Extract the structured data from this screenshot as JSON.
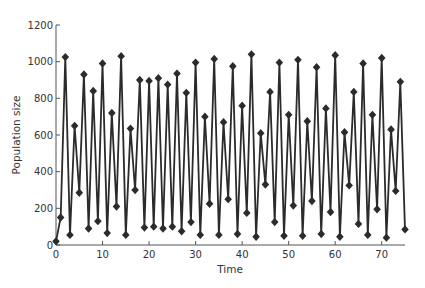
{
  "chart_data": {
    "type": "line",
    "title": "",
    "xlabel": "Time",
    "ylabel": "Population size",
    "xlim": [
      0,
      75
    ],
    "ylim": [
      0,
      1200
    ],
    "x_ticks": [
      0,
      10,
      20,
      30,
      40,
      50,
      60,
      70
    ],
    "y_ticks": [
      0,
      200,
      400,
      600,
      800,
      1000,
      1200
    ],
    "grid": false,
    "legend": null,
    "marker": "diamond",
    "series": [
      {
        "name": "Population size",
        "color": "#2b2b2b",
        "x": [
          0,
          1,
          2,
          3,
          4,
          5,
          6,
          7,
          8,
          9,
          10,
          11,
          12,
          13,
          14,
          15,
          16,
          17,
          18,
          19,
          20,
          21,
          22,
          23,
          24,
          25,
          26,
          27,
          28,
          29,
          30,
          31,
          32,
          33,
          34,
          35,
          36,
          37,
          38,
          39,
          40,
          41,
          42,
          43,
          44,
          45,
          46,
          47,
          48,
          49,
          50,
          51,
          52,
          53,
          54,
          55,
          56,
          57,
          58,
          59,
          60,
          61,
          62,
          63,
          64,
          65,
          66,
          67,
          68,
          69,
          70,
          71,
          72,
          73,
          74,
          75
        ],
        "values": [
          20,
          150,
          1025,
          55,
          650,
          285,
          930,
          90,
          840,
          130,
          990,
          65,
          720,
          210,
          1030,
          55,
          635,
          300,
          900,
          95,
          895,
          100,
          910,
          90,
          875,
          100,
          935,
          75,
          830,
          125,
          995,
          55,
          700,
          225,
          1015,
          55,
          670,
          250,
          975,
          60,
          760,
          175,
          1040,
          45,
          610,
          330,
          835,
          125,
          995,
          50,
          710,
          215,
          1010,
          50,
          675,
          240,
          970,
          60,
          745,
          180,
          1035,
          45,
          615,
          325,
          835,
          115,
          990,
          55,
          710,
          195,
          1020,
          40,
          630,
          295,
          890,
          85
        ]
      }
    ]
  }
}
